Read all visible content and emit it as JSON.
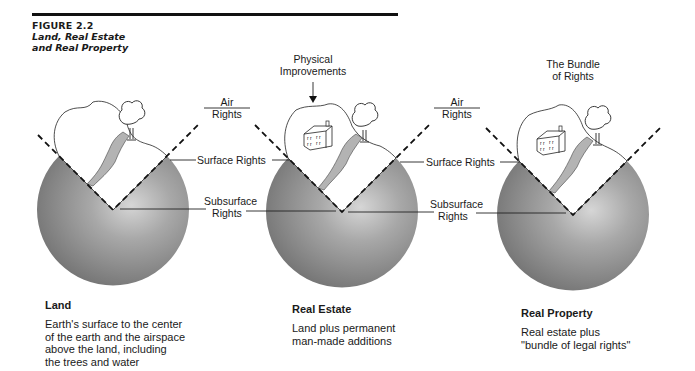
{
  "figure": {
    "number": "FIGURE 2.2",
    "title_line1": "Land, Real Estate",
    "title_line2": "and Real Property"
  },
  "top_labels": {
    "physical_improvements": [
      "Physical",
      "Improvements"
    ],
    "bundle_of_rights": [
      "The Bundle",
      "of Rights"
    ]
  },
  "rights_labels": {
    "air": [
      "Air",
      "Rights"
    ],
    "surface": "Surface Rights",
    "subsurface": [
      "Subsurface",
      "Rights"
    ]
  },
  "panels": [
    {
      "name": "Land",
      "description_lines": [
        "Earth's surface to the center",
        "of the earth and the airspace",
        "above the land, including",
        "the trees and water"
      ],
      "has_house": false
    },
    {
      "name": "Real Estate",
      "description_lines": [
        "Land plus permanent",
        "man-made additions"
      ],
      "has_house": true
    },
    {
      "name": "Real Property",
      "description_lines": [
        "Real estate plus",
        "\"bundle of legal rights\""
      ],
      "has_house": true
    }
  ],
  "colors": {
    "sphere_light": "#bdbdbd",
    "sphere_dark": "#6e6e6e",
    "river": "#b3b3b3",
    "ink": "#1a1a1a"
  }
}
